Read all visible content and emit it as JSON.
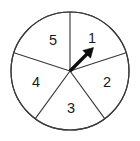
{
  "figure": {
    "name": "spinner-wheel",
    "type": "five-sector-spinner",
    "background_color": "#ffffff",
    "outline_color": "#3a3a3a",
    "label_color": "#1a1a1a",
    "pointer_color": "#0d0d0d"
  },
  "wheel": {
    "center_x": 70,
    "center_y": 71,
    "radius": 59,
    "sector_count": 5
  },
  "sectors": [
    {
      "label": "1",
      "label_x": 92,
      "label_y": 38,
      "start_angle_deg": 18,
      "end_angle_deg": 90
    },
    {
      "label": "2",
      "label_x": 107,
      "label_y": 82,
      "start_angle_deg": -54,
      "end_angle_deg": 18
    },
    {
      "label": "3",
      "label_x": 71,
      "label_y": 108,
      "start_angle_deg": -126,
      "end_angle_deg": -54
    },
    {
      "label": "4",
      "label_x": 36,
      "label_y": 82,
      "start_angle_deg": 162,
      "end_angle_deg": 234
    },
    {
      "label": "5",
      "label_x": 53,
      "label_y": 40,
      "start_angle_deg": 90,
      "end_angle_deg": 162
    }
  ],
  "dividers": [
    {
      "name": "divider-top",
      "angle_deg": 90,
      "x2": 70,
      "y2": 12
    },
    {
      "name": "divider-upper-right",
      "angle_deg": 18,
      "x2": 126,
      "y2": 53
    },
    {
      "name": "divider-lower-right",
      "angle_deg": -54,
      "x2": 105,
      "y2": 119
    },
    {
      "name": "divider-lower-left",
      "angle_deg": -126,
      "x2": 35,
      "y2": 119
    },
    {
      "name": "divider-upper-left",
      "angle_deg": 162,
      "x2": 14,
      "y2": 53
    }
  ],
  "pointer": {
    "name": "spinner-pointer",
    "angle_deg": 44,
    "points_to_sector": "1",
    "tail_x": 70,
    "tail_y": 71,
    "tip_x": 93,
    "tip_y": 48,
    "shaft_end_x": 87,
    "shaft_end_y": 54,
    "head_points": "93,48 83.5,50.5 90.5,57.5"
  }
}
